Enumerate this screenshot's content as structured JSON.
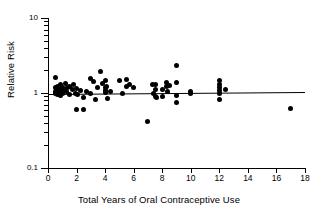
{
  "chart_data": {
    "type": "scatter",
    "title": "",
    "xlabel": "Total Years of Oral Contraceptive Use",
    "ylabel": "Relative Risk",
    "xlim": [
      0,
      18
    ],
    "ylim": [
      0.1,
      10
    ],
    "yscale": "log",
    "xscale": "linear",
    "grid": false,
    "legend": null,
    "xticks": [
      0,
      2,
      4,
      6,
      8,
      10,
      12,
      14,
      16,
      18
    ],
    "xtick_labels": [
      "0",
      "2",
      "4",
      "6",
      "8",
      "10",
      "12",
      "14",
      "16",
      "18"
    ],
    "yticks": [
      0.1,
      1,
      10
    ],
    "ytick_labels": [
      "0.1",
      "1",
      "10"
    ],
    "y_minor_ticks": [
      0.2,
      0.3,
      0.4,
      0.5,
      0.6,
      0.7,
      0.8,
      0.9,
      2,
      3,
      4,
      5,
      6,
      7,
      8,
      9
    ],
    "marker": "filled-circle",
    "marker_color": "#000000",
    "fit_line": {
      "label": "regression line",
      "color": "#000000",
      "x_start": 0.0,
      "x_end": 18.0,
      "y_start": 0.97,
      "y_end": 1.03
    },
    "points": [
      {
        "x": 0.5,
        "y": 1.62
      },
      {
        "x": 0.5,
        "y": 1.18
      },
      {
        "x": 0.5,
        "y": 1.05
      },
      {
        "x": 0.5,
        "y": 1.0
      },
      {
        "x": 0.6,
        "y": 1.1
      },
      {
        "x": 0.6,
        "y": 0.98
      },
      {
        "x": 0.7,
        "y": 1.22
      },
      {
        "x": 0.7,
        "y": 1.08
      },
      {
        "x": 0.7,
        "y": 0.95
      },
      {
        "x": 0.8,
        "y": 1.15
      },
      {
        "x": 0.8,
        "y": 1.02
      },
      {
        "x": 0.9,
        "y": 1.28
      },
      {
        "x": 0.9,
        "y": 1.06
      },
      {
        "x": 0.9,
        "y": 0.92
      },
      {
        "x": 1.0,
        "y": 1.2
      },
      {
        "x": 1.0,
        "y": 1.0
      },
      {
        "x": 1.1,
        "y": 1.12
      },
      {
        "x": 1.2,
        "y": 1.32
      },
      {
        "x": 1.3,
        "y": 1.04
      },
      {
        "x": 1.4,
        "y": 1.18
      },
      {
        "x": 1.5,
        "y": 1.22
      },
      {
        "x": 1.5,
        "y": 0.95
      },
      {
        "x": 1.7,
        "y": 1.1
      },
      {
        "x": 1.8,
        "y": 1.3
      },
      {
        "x": 1.9,
        "y": 1.0
      },
      {
        "x": 2.0,
        "y": 1.15
      },
      {
        "x": 2.0,
        "y": 0.6
      },
      {
        "x": 2.1,
        "y": 0.95
      },
      {
        "x": 2.3,
        "y": 1.08
      },
      {
        "x": 2.5,
        "y": 0.6
      },
      {
        "x": 2.5,
        "y": 0.88
      },
      {
        "x": 2.7,
        "y": 1.05
      },
      {
        "x": 3.0,
        "y": 1.55
      },
      {
        "x": 3.0,
        "y": 1.0
      },
      {
        "x": 3.2,
        "y": 1.42
      },
      {
        "x": 3.3,
        "y": 0.82
      },
      {
        "x": 3.5,
        "y": 1.18
      },
      {
        "x": 3.7,
        "y": 1.95
      },
      {
        "x": 3.8,
        "y": 1.35
      },
      {
        "x": 4.0,
        "y": 1.45
      },
      {
        "x": 4.0,
        "y": 1.2
      },
      {
        "x": 4.0,
        "y": 1.08
      },
      {
        "x": 4.0,
        "y": 1.02
      },
      {
        "x": 4.1,
        "y": 1.22
      },
      {
        "x": 4.2,
        "y": 0.85
      },
      {
        "x": 4.4,
        "y": 1.05
      },
      {
        "x": 5.0,
        "y": 1.48
      },
      {
        "x": 5.2,
        "y": 1.0
      },
      {
        "x": 5.5,
        "y": 1.5
      },
      {
        "x": 5.5,
        "y": 1.22
      },
      {
        "x": 5.7,
        "y": 1.3
      },
      {
        "x": 6.0,
        "y": 1.18
      },
      {
        "x": 7.0,
        "y": 0.42
      },
      {
        "x": 7.3,
        "y": 1.28
      },
      {
        "x": 7.4,
        "y": 1.0
      },
      {
        "x": 7.5,
        "y": 1.3
      },
      {
        "x": 7.5,
        "y": 1.1
      },
      {
        "x": 7.5,
        "y": 0.9
      },
      {
        "x": 7.6,
        "y": 0.88
      },
      {
        "x": 8.0,
        "y": 1.12
      },
      {
        "x": 8.0,
        "y": 0.9
      },
      {
        "x": 8.3,
        "y": 1.4
      },
      {
        "x": 8.3,
        "y": 1.22
      },
      {
        "x": 8.4,
        "y": 1.05
      },
      {
        "x": 8.5,
        "y": 1.26
      },
      {
        "x": 9.0,
        "y": 2.3
      },
      {
        "x": 9.0,
        "y": 1.38
      },
      {
        "x": 9.0,
        "y": 0.92
      },
      {
        "x": 9.0,
        "y": 0.75
      },
      {
        "x": 10.0,
        "y": 1.05
      },
      {
        "x": 10.0,
        "y": 0.98
      },
      {
        "x": 12.0,
        "y": 1.45
      },
      {
        "x": 12.0,
        "y": 1.3
      },
      {
        "x": 12.0,
        "y": 1.18
      },
      {
        "x": 12.0,
        "y": 1.08
      },
      {
        "x": 12.0,
        "y": 1.0
      },
      {
        "x": 12.0,
        "y": 0.82
      },
      {
        "x": 12.4,
        "y": 1.12
      },
      {
        "x": 17.0,
        "y": 0.62
      }
    ]
  }
}
